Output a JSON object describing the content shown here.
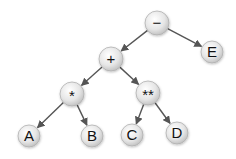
{
  "diagram": {
    "type": "expression-tree",
    "nodes": [
      {
        "id": "minus",
        "label": "−",
        "x": 157,
        "y": 23,
        "r": 12
      },
      {
        "id": "E",
        "label": "E",
        "x": 212,
        "y": 52,
        "r": 11
      },
      {
        "id": "plus",
        "label": "+",
        "x": 111,
        "y": 59,
        "r": 12
      },
      {
        "id": "star",
        "label": "*",
        "x": 72,
        "y": 94,
        "r": 12
      },
      {
        "id": "pow",
        "label": "**",
        "x": 148,
        "y": 93,
        "r": 12
      },
      {
        "id": "A",
        "label": "A",
        "x": 29,
        "y": 136,
        "r": 11
      },
      {
        "id": "B",
        "label": "B",
        "x": 92,
        "y": 136,
        "r": 11
      },
      {
        "id": "C",
        "label": "C",
        "x": 132,
        "y": 135,
        "r": 11
      },
      {
        "id": "D",
        "label": "D",
        "x": 177,
        "y": 133,
        "r": 11
      }
    ],
    "edges": [
      {
        "from": "minus",
        "to": "plus"
      },
      {
        "from": "minus",
        "to": "E"
      },
      {
        "from": "plus",
        "to": "star"
      },
      {
        "from": "plus",
        "to": "pow"
      },
      {
        "from": "star",
        "to": "A"
      },
      {
        "from": "star",
        "to": "B"
      },
      {
        "from": "pow",
        "to": "C"
      },
      {
        "from": "pow",
        "to": "D"
      }
    ],
    "colors": {
      "node_fill_light": "#f4f4f4",
      "node_fill_dark": "#c8c8c8",
      "node_stroke": "#b0b0b0",
      "edge": "#555555",
      "text": "#111111"
    }
  }
}
